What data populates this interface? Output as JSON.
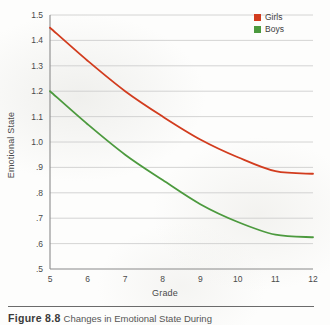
{
  "figure": {
    "caption_label": "Figure 8.8",
    "caption_text": "Changes in Emotional State During"
  },
  "chart_data": {
    "type": "line",
    "title": "",
    "subtitle": "",
    "xlabel": "Grade",
    "ylabel": "Emotional State",
    "xlim": [
      5,
      12
    ],
    "ylim": [
      0.5,
      1.5
    ],
    "grid": "horizontal",
    "legend_position": "top-right",
    "x": [
      5,
      6,
      7,
      8,
      9,
      10,
      11,
      12
    ],
    "xtick_labels": [
      "5",
      "6",
      "7",
      "8",
      "9",
      "10",
      "11",
      "12"
    ],
    "ytick_labels": [
      "1.5",
      "1.4",
      "1.3",
      "1.2",
      "1.1",
      "1.0",
      ".9",
      ".8",
      ".7",
      ".6",
      ".5"
    ],
    "ytick_values": [
      1.5,
      1.4,
      1.3,
      1.2,
      1.1,
      1.0,
      0.9,
      0.8,
      0.7,
      0.6,
      0.5
    ],
    "series": [
      {
        "name": "Girls",
        "color": "#D23C1E",
        "values": [
          1.45,
          1.32,
          1.2,
          1.1,
          1.01,
          0.94,
          0.885,
          0.875
        ]
      },
      {
        "name": "Boys",
        "color": "#4C9A3E",
        "values": [
          1.2,
          1.07,
          0.95,
          0.85,
          0.755,
          0.685,
          0.635,
          0.625
        ]
      }
    ]
  },
  "colors": {
    "girls": "#D23C1E",
    "boys": "#4C9A3E",
    "grid": "#c9c9c9",
    "axis": "#8a8a8a",
    "text": "#4a4a4a"
  }
}
